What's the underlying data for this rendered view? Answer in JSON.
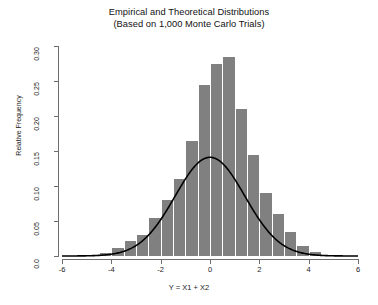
{
  "chart": {
    "title_lines": [
      "Empirical and Theoretical Distributions",
      "(Based on 1,000 Monte Carlo Trials)"
    ],
    "xlabel": "Y = X1 + X2",
    "ylabel": "Relative Frequency",
    "xticks": [
      "-6",
      "-4",
      "-2",
      "0",
      "2",
      "4",
      "6"
    ],
    "yticks": [
      "0.0",
      "0.05",
      "0.10",
      "0.15",
      "0.20",
      "0.25",
      "0.30"
    ],
    "bar_color": "#808080",
    "curve_color": "#000000",
    "axis_color": "#6e6e6e"
  },
  "chart_data": {
    "type": "bar",
    "title": "Empirical and Theoretical Distributions (Based on 1,000 Monte Carlo Trials)",
    "subtitle": "(Based on 1,000 Monte Carlo Trials)",
    "xlabel": "Y = X1 + X2",
    "ylabel": "Relative Frequency",
    "xlim": [
      -6,
      6
    ],
    "ylim": [
      0,
      0.3
    ],
    "xtick_values": [
      -6,
      -4,
      -2,
      0,
      2,
      4,
      6
    ],
    "ytick_values": [
      0.0,
      0.05,
      0.1,
      0.15,
      0.2,
      0.25,
      0.3
    ],
    "grid": false,
    "legend": null,
    "bin_width": 0.5,
    "n_trials": 1000,
    "bin_centers": [
      -4.25,
      -3.75,
      -3.25,
      -2.75,
      -2.25,
      -1.75,
      -1.25,
      -0.75,
      -0.25,
      0.25,
      0.75,
      1.25,
      1.75,
      2.25,
      2.75,
      3.25,
      3.75,
      4.25
    ],
    "bin_edges": [
      -4.5,
      -4.0,
      -3.5,
      -3.0,
      -2.5,
      -2.0,
      -1.5,
      -1.0,
      -0.5,
      0.0,
      0.5,
      1.0,
      1.5,
      2.0,
      2.5,
      3.0,
      3.5,
      4.0,
      4.5
    ],
    "values": [
      0.005,
      0.012,
      0.022,
      0.03,
      0.055,
      0.08,
      0.11,
      0.165,
      0.245,
      0.275,
      0.285,
      0.21,
      0.145,
      0.09,
      0.06,
      0.035,
      0.015,
      0.006
    ],
    "series": [
      {
        "name": "Empirical (histogram)",
        "type": "bar",
        "values": [
          0.005,
          0.012,
          0.022,
          0.03,
          0.055,
          0.08,
          0.11,
          0.165,
          0.245,
          0.275,
          0.285,
          0.21,
          0.145,
          0.09,
          0.06,
          0.035,
          0.015,
          0.006
        ]
      },
      {
        "name": "Theoretical (normal density)",
        "type": "line",
        "mean": 0.0,
        "sd": 1.4142,
        "scale": 0.5,
        "peak_value": 0.283
      }
    ]
  }
}
